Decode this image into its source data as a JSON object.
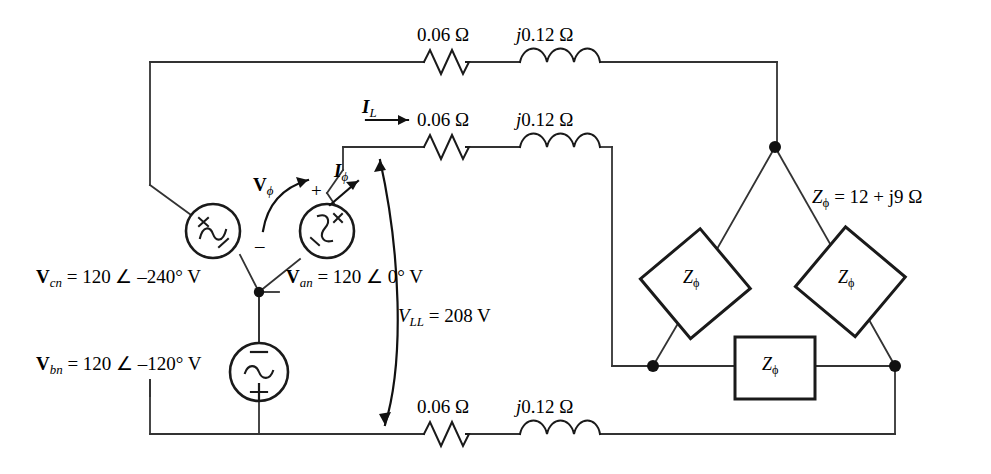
{
  "figure": {
    "type": "circuit-schematic"
  },
  "lines": {
    "top": {
      "resistor": "0.06 Ω",
      "inductor": "j0.12 Ω"
    },
    "middle": {
      "current_label_bold": "I",
      "current_label_sub": "L",
      "resistor": "0.06 Ω",
      "inductor": "j0.12 Ω"
    },
    "bottom": {
      "resistor": "0.06 Ω",
      "inductor": "j0.12 Ω"
    }
  },
  "sources": {
    "vcn": {
      "label_bold": "V",
      "label_sub": "cn",
      "value": "= 120 ∠ –240° V",
      "plus": "+",
      "minus": "–"
    },
    "van": {
      "label_bold": "V",
      "label_sub": "an",
      "value": "= 120 ∠ 0° V",
      "plus": "+",
      "minus": "–"
    },
    "vbn": {
      "label_bold": "V",
      "label_sub": "bn",
      "value": "= 120 ∠ –120° V",
      "plus": "+",
      "minus": "–"
    }
  },
  "annotations": {
    "vphi_bold": "V",
    "vphi_sub": "ϕ",
    "vphi_polarity_plus": "+",
    "vphi_polarity_minus": "–",
    "iphi_bold": "I",
    "iphi_sub": "ϕ",
    "vll_italic": "V",
    "vll_sub": "LL",
    "vll_value": "= 208 V"
  },
  "load": {
    "impedance_symbol": "Z",
    "impedance_sub": "ϕ",
    "impedance_value": "= 12 + j9 Ω",
    "box_label_symbol": "Z",
    "box_label_sub": "ϕ",
    "boxes": [
      {
        "name": "left-branch",
        "label": "Zϕ"
      },
      {
        "name": "right-branch",
        "label": "Zϕ"
      },
      {
        "name": "bottom-branch",
        "label": "Zϕ"
      }
    ]
  },
  "colors": {
    "wire": "#333333",
    "component": "#1a1a1a",
    "text": "#000000",
    "background": "#ffffff"
  }
}
